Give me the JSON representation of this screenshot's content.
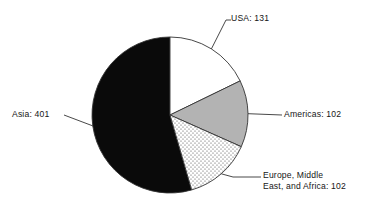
{
  "chart_data": {
    "type": "pie",
    "title": "",
    "subtitle": "",
    "xlabel": "",
    "ylabel": "",
    "legend_position": "callout-labels",
    "grid": false,
    "total": 736,
    "units": "",
    "start_angle_deg": 0,
    "direction": "clockwise",
    "categories": [
      "USA",
      "Americas",
      "Europe, Middle East, and Africa",
      "Asia"
    ],
    "values": [
      131,
      102,
      102,
      401
    ],
    "slices": [
      {
        "name": "USA",
        "value": 131,
        "label": "USA: 131",
        "fill": "white",
        "color": "#ffffff",
        "start_deg": 0,
        "end_deg": 64.08,
        "percent": 17.8
      },
      {
        "name": "Americas",
        "value": 102,
        "label": "Americas: 102",
        "fill": "gray",
        "color": "#b3b3b3",
        "start_deg": 64.08,
        "end_deg": 113.97,
        "percent": 13.9
      },
      {
        "name": "Europe, Middle East, and Africa",
        "value": 102,
        "label_line1": "Europe, Middle",
        "label_line2": "East, and Africa: 102",
        "fill": "dotted",
        "color": "#ffffff",
        "start_deg": 113.97,
        "end_deg": 163.86,
        "percent": 13.9
      },
      {
        "name": "Asia",
        "value": 401,
        "label": "Asia: 401",
        "fill": "black",
        "color": "#0a0a0a",
        "start_deg": 163.86,
        "end_deg": 360,
        "percent": 54.5
      }
    ],
    "colors": {
      "outline": "#333333",
      "black_slice": "#0a0a0a",
      "gray_slice": "#b3b3b3",
      "white_slice": "#ffffff",
      "background": "#ffffff",
      "text": "#161616"
    },
    "geometry": {
      "center_x": 170,
      "center_y": 115,
      "radius": 78
    }
  }
}
